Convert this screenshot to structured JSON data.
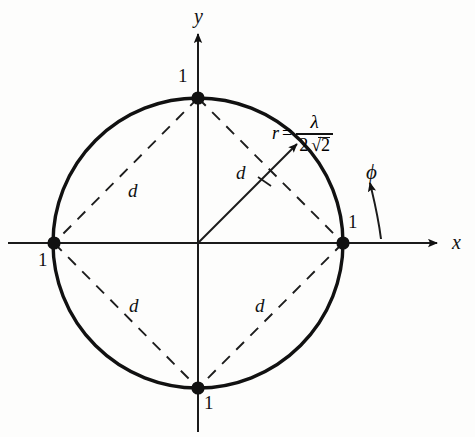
{
  "figure": {
    "kind": "geometry-diagram",
    "background_color": "#fdfdfc",
    "ink_color": "#111111"
  },
  "axes": {
    "x_label": "x",
    "y_label": "y",
    "origin": {
      "x": 198,
      "y": 243
    }
  },
  "circle": {
    "center": {
      "x": 198,
      "y": 243
    },
    "radius_px": 145,
    "radius_label_lhs": "r",
    "radius_label_equals": "=",
    "radius_numerator": "λ",
    "radius_denominator_coefficient": "2",
    "radius_denominator_radicand": "2",
    "radius_formula_plain": "r = λ / (2√2)"
  },
  "angle": {
    "symbol": "ϕ"
  },
  "points": [
    {
      "name": "point-top",
      "label": "1",
      "x": 198,
      "y": 98
    },
    {
      "name": "point-right",
      "label": "1",
      "x": 343,
      "y": 243
    },
    {
      "name": "point-bottom",
      "label": "1",
      "x": 198,
      "y": 388
    },
    {
      "name": "point-left",
      "label": "1",
      "x": 54,
      "y": 243
    }
  ],
  "distance_labels": [
    {
      "name": "d-upper-left",
      "label": "d"
    },
    {
      "name": "d-upper-right",
      "label": "d"
    },
    {
      "name": "d-lower-left",
      "label": "d"
    },
    {
      "name": "d-lower-right",
      "label": "d"
    }
  ]
}
